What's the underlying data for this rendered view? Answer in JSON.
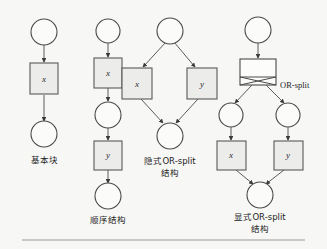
{
  "figure": {
    "background_color": "#f7f7f5",
    "node_fill_circle": "#fbfbfa",
    "node_fill_square": "#ececeb",
    "stroke_color": "#4a4a4a",
    "rule_color": "#9a9a9a"
  },
  "annotations": {
    "or_split_callout": "OR-split"
  },
  "panels": [
    {
      "id": "basic-block",
      "caption_line1": "基本块",
      "caption_line2": "",
      "nodes": [
        {
          "kind": "place",
          "name": "start-place",
          "label": ""
        },
        {
          "kind": "transition",
          "name": "transition-x",
          "label": "x"
        },
        {
          "kind": "place",
          "name": "end-place",
          "label": ""
        }
      ]
    },
    {
      "id": "sequence",
      "caption_line1": "顺序结构",
      "caption_line2": "",
      "nodes": [
        {
          "kind": "place",
          "name": "start-place",
          "label": ""
        },
        {
          "kind": "transition",
          "name": "transition-x",
          "label": "x"
        },
        {
          "kind": "place",
          "name": "middle-place",
          "label": ""
        },
        {
          "kind": "transition",
          "name": "transition-y",
          "label": "y"
        },
        {
          "kind": "place",
          "name": "end-place",
          "label": ""
        }
      ]
    },
    {
      "id": "implicit-or-split",
      "caption_line1": "隐式OR-split",
      "caption_line2": "结构",
      "nodes": [
        {
          "kind": "place",
          "name": "start-place",
          "label": ""
        },
        {
          "kind": "transition",
          "name": "transition-x",
          "label": "x"
        },
        {
          "kind": "transition",
          "name": "transition-y",
          "label": "y"
        },
        {
          "kind": "place",
          "name": "end-place",
          "label": ""
        }
      ]
    },
    {
      "id": "explicit-or-split",
      "caption_line1": "显式OR-split",
      "caption_line2": "结构",
      "nodes": [
        {
          "kind": "place",
          "name": "start-place",
          "label": ""
        },
        {
          "kind": "gate",
          "name": "or-split-gate",
          "label": ""
        },
        {
          "kind": "place",
          "name": "left-place",
          "label": ""
        },
        {
          "kind": "place",
          "name": "right-place",
          "label": ""
        },
        {
          "kind": "transition",
          "name": "transition-x",
          "label": "x"
        },
        {
          "kind": "transition",
          "name": "transition-y",
          "label": "y"
        },
        {
          "kind": "place",
          "name": "end-place",
          "label": ""
        }
      ]
    }
  ]
}
